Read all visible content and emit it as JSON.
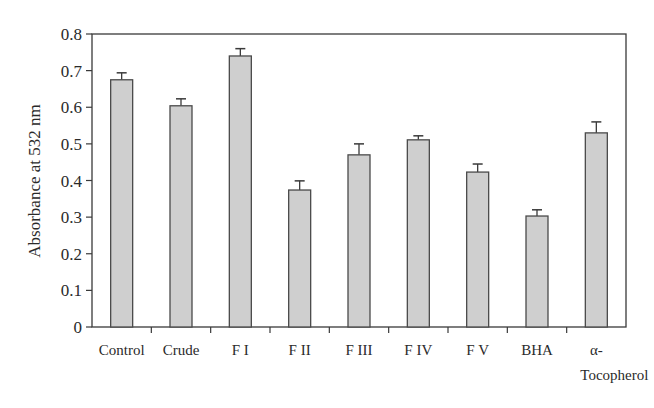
{
  "chart_data": {
    "type": "bar",
    "title": "",
    "xlabel": "",
    "ylabel": "Absorbance at 532 nm",
    "ylim": [
      0,
      0.8
    ],
    "yticks": [
      0,
      0.1,
      0.2,
      0.3,
      0.4,
      0.5,
      0.6,
      0.7,
      0.8
    ],
    "ytick_labels": [
      "0",
      "0.1",
      "0.2",
      "0.3",
      "0.4",
      "0.5",
      "0.6",
      "0.7",
      "0.8"
    ],
    "categories": [
      "Control",
      "Crude",
      "F I",
      "F II",
      "F III",
      "F IV",
      "F V",
      "BHA",
      "α-Tocopherol"
    ],
    "category_label_lines": [
      [
        "Control"
      ],
      [
        "Crude"
      ],
      [
        "F I"
      ],
      [
        "F II"
      ],
      [
        "F III"
      ],
      [
        "F IV"
      ],
      [
        "F V"
      ],
      [
        "BHA"
      ],
      [
        "α-",
        "Tocopherol"
      ]
    ],
    "values": [
      0.675,
      0.604,
      0.74,
      0.374,
      0.47,
      0.511,
      0.423,
      0.303,
      0.53
    ],
    "error": [
      0.019,
      0.019,
      0.02,
      0.025,
      0.03,
      0.011,
      0.022,
      0.017,
      0.03
    ],
    "grid": false,
    "legend": null,
    "colors": {
      "bar_fill": "#cfcfcf",
      "bar_stroke": "#4a4a4a",
      "axis": "#3a3a3a"
    }
  }
}
